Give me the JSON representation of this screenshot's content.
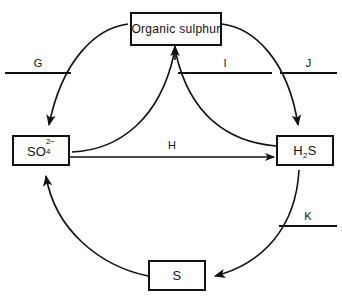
{
  "diagram": {
    "background_color": "#ffffff",
    "stroke_color": "#111111",
    "nodes": [
      {
        "id": "organic-sulphur",
        "label": "Organic  sulphur",
        "position": "top"
      },
      {
        "id": "sulphate",
        "label_base": "SO",
        "label_sub": "4",
        "label_sup": "2−",
        "position": "left"
      },
      {
        "id": "hydrogen-sulphide",
        "label_base": "H",
        "label_sub": "2",
        "label_tail": "S",
        "position": "right"
      },
      {
        "id": "elemental-sulphur",
        "label": "S",
        "position": "bottom"
      }
    ],
    "process_labels": [
      {
        "id": "G",
        "text": "G",
        "underlined": true
      },
      {
        "id": "I",
        "text": "I",
        "underlined": true
      },
      {
        "id": "J",
        "text": "J",
        "underlined": true
      },
      {
        "id": "K",
        "text": "K",
        "underlined": true
      },
      {
        "id": "H",
        "text": "H",
        "underlined": false
      }
    ],
    "edges": [
      {
        "from": "organic-sulphur",
        "to": "sulphate",
        "style": "curved",
        "label": "G"
      },
      {
        "from": "sulphate",
        "to": "organic-sulphur",
        "style": "curved",
        "label": "I"
      },
      {
        "from": "hydrogen-sulphide",
        "to": "organic-sulphur",
        "style": "curved",
        "label": "I"
      },
      {
        "from": "organic-sulphur",
        "to": "hydrogen-sulphide",
        "style": "curved",
        "label": "J"
      },
      {
        "from": "sulphate",
        "to": "hydrogen-sulphide",
        "style": "straight",
        "label": "H"
      },
      {
        "from": "hydrogen-sulphide",
        "to": "elemental-sulphur",
        "style": "curved",
        "label": "K"
      },
      {
        "from": "elemental-sulphur",
        "to": "sulphate",
        "style": "curved",
        "label": ""
      }
    ]
  }
}
